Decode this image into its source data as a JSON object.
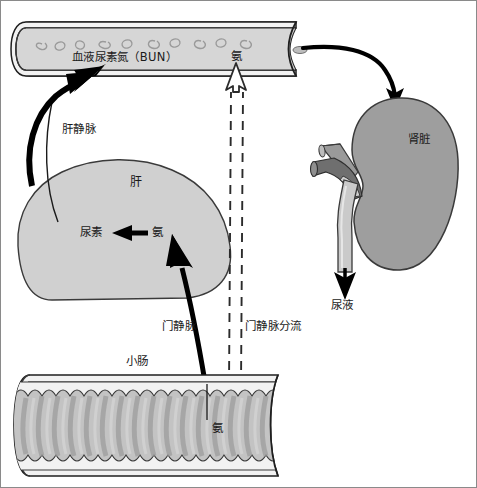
{
  "diagram": {
    "title_top": "体循环",
    "labels": {
      "bun": "血液尿素氮（BUN）",
      "ammonia_blood": "氨",
      "hepatic_vein": "肝静脉",
      "liver": "肝",
      "urea": "尿素",
      "ammonia_liver": "氨",
      "kidney": "肾脏",
      "urine": "尿液",
      "portal_vein": "门静脉",
      "portal_shunt": "门静脉分流",
      "small_intestine": "小肠",
      "ammonia_intestine": "氨"
    },
    "colors": {
      "organ_fill": "#c9c9c9",
      "organ_stroke": "#4a4a4a",
      "vessel_fill": "#d2d2d2",
      "vessel_stroke": "#2b2b2b",
      "artery_dark": "#777777",
      "vein_light": "#c2c2c2",
      "arrow_black": "#000000",
      "text": "#1a1a1a",
      "frame": "#8a8a8a",
      "background": "#ffffff",
      "villi_fill": "#b8b8b8"
    }
  }
}
